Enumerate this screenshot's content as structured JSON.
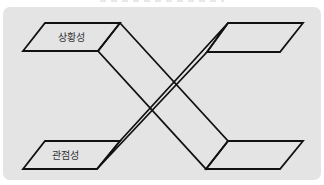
{
  "diagram": {
    "labels": {
      "top_left": "상황성",
      "bottom_left": "관점성"
    },
    "colors": {
      "panel_background": "#e4e4e4",
      "stroke": "#111111",
      "label_text": "#333333"
    }
  }
}
